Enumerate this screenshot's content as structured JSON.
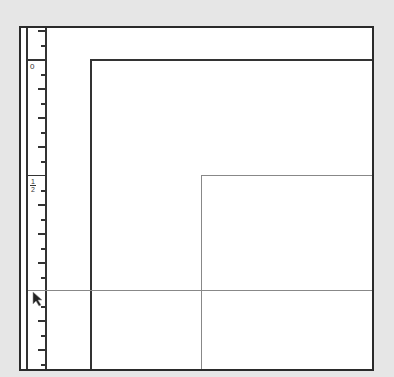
{
  "ruler": {
    "labels": {
      "zero": "0",
      "half_num": "1",
      "half_den": "2"
    },
    "origin_y": 59,
    "unit_px": 232
  },
  "canvas": {
    "page_rect": {
      "left": 90,
      "top": 59
    },
    "inner_rect": {
      "left": 201,
      "top": 175
    },
    "guide_horizontal_y": 290
  },
  "colors": {
    "background": "#e6e6e6",
    "frame": "#2a2a2a",
    "page_line": "#333333",
    "guide_line": "#888888"
  },
  "cursor": {
    "icon": "arrow-pointer-icon",
    "x": 32,
    "y": 290
  }
}
